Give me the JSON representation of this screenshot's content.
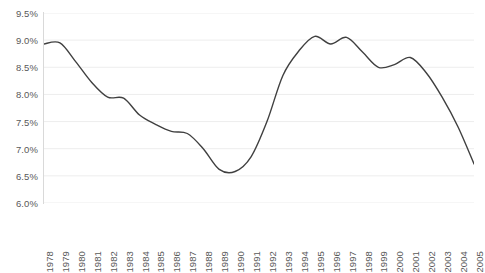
{
  "chart_data": {
    "type": "line",
    "title": "",
    "subtitle": "",
    "xlabel": "",
    "ylabel": "",
    "grid": true,
    "legend_position": "none",
    "line_color": "#404040",
    "grid_color": "#ededed",
    "tick_label_color": "#595959",
    "ylim": [
      6.0,
      9.5
    ],
    "ytick_values": [
      6.0,
      6.5,
      7.0,
      7.5,
      8.0,
      8.5,
      9.0,
      9.5
    ],
    "ytick_labels": [
      "6.0%",
      "6.5%",
      "7.0%",
      "7.5%",
      "8.0%",
      "8.5%",
      "9.0%",
      "9.5%"
    ],
    "categories": [
      "1978",
      "1979",
      "1980",
      "1981",
      "1982",
      "1983",
      "1984",
      "1985",
      "1986",
      "1987",
      "1988",
      "1989",
      "1990",
      "1991",
      "1992",
      "1993",
      "1994",
      "1995",
      "1996",
      "1997",
      "1998",
      "1999",
      "2000",
      "2001",
      "2002",
      "2003",
      "2004",
      "2005"
    ],
    "x": [
      1978,
      1979,
      1980,
      1981,
      1982,
      1983,
      1984,
      1985,
      1986,
      1987,
      1988,
      1989,
      1990,
      1991,
      1992,
      1993,
      1994,
      1995,
      1996,
      1997,
      1998,
      1999,
      2000,
      2001,
      2002,
      2003,
      2004,
      2005
    ],
    "values": [
      8.93,
      8.95,
      8.6,
      8.22,
      7.95,
      7.93,
      7.62,
      7.45,
      7.32,
      7.28,
      7.0,
      6.62,
      6.58,
      6.85,
      7.5,
      8.35,
      8.8,
      9.07,
      8.93,
      9.05,
      8.78,
      8.5,
      8.55,
      8.68,
      8.4,
      7.95,
      7.4,
      6.72
    ],
    "series": [
      {
        "name": "series-1",
        "values": [
          8.93,
          8.95,
          8.6,
          8.22,
          7.95,
          7.93,
          7.62,
          7.45,
          7.32,
          7.28,
          7.0,
          6.62,
          6.58,
          6.85,
          7.5,
          8.35,
          8.8,
          9.07,
          8.93,
          9.05,
          8.78,
          8.5,
          8.55,
          8.68,
          8.4,
          7.95,
          7.4,
          6.72
        ]
      }
    ]
  }
}
